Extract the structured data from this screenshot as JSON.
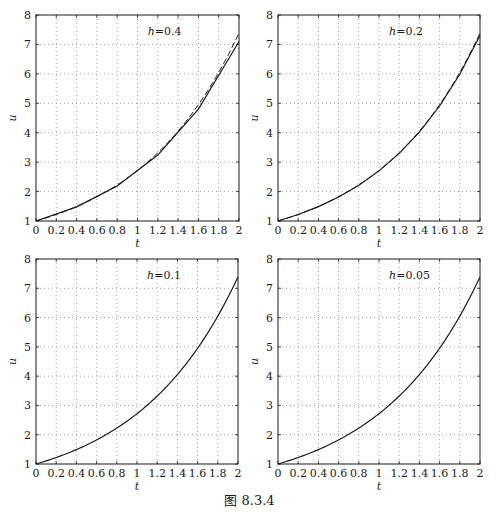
{
  "figure": {
    "caption": "图 8.3.4",
    "line_color": "#1a1a1a",
    "grid_color": "#8a8a8a",
    "background": "#ffffff"
  },
  "chart_data": [
    {
      "type": "line",
      "title": "",
      "annotation": "h=0.4",
      "xlabel": "t",
      "ylabel": "u",
      "xlim": [
        0,
        2
      ],
      "ylim": [
        1,
        8
      ],
      "xticks": [
        "0",
        "0.2",
        "0.4",
        "0.6",
        "0.8",
        "1",
        "1.2",
        "1.4",
        "1.6",
        "1.8",
        "2"
      ],
      "yticks": [
        "1",
        "2",
        "3",
        "4",
        "5",
        "6",
        "7",
        "8"
      ],
      "grid": true,
      "series": [
        {
          "name": "numerical",
          "style": "solid",
          "x": [
            0,
            0.4,
            0.8,
            1.2,
            1.6,
            2.0
          ],
          "y": [
            1.0,
            1.48,
            2.19,
            3.24,
            4.8,
            7.1
          ]
        },
        {
          "name": "exact e^t",
          "style": "dashed",
          "x": [
            0,
            0.2,
            0.4,
            0.6,
            0.8,
            1.0,
            1.2,
            1.4,
            1.6,
            1.8,
            2.0
          ],
          "y": [
            1.0,
            1.221,
            1.492,
            1.822,
            2.226,
            2.718,
            3.32,
            4.055,
            4.953,
            6.05,
            7.389
          ]
        }
      ]
    },
    {
      "type": "line",
      "title": "",
      "annotation": "h=0.2",
      "xlabel": "t",
      "ylabel": "u",
      "xlim": [
        0,
        2
      ],
      "ylim": [
        1,
        8
      ],
      "xticks": [
        "0",
        "0.2",
        "0.4",
        "0.6",
        "0.8",
        "1",
        "1.2",
        "1.4",
        "1.6",
        "1.8",
        "2"
      ],
      "yticks": [
        "1",
        "2",
        "3",
        "4",
        "5",
        "6",
        "7",
        "8"
      ],
      "grid": true,
      "series": [
        {
          "name": "numerical",
          "style": "solid",
          "x": [
            0,
            0.2,
            0.4,
            0.6,
            0.8,
            1.0,
            1.2,
            1.4,
            1.6,
            1.8,
            2.0
          ],
          "y": [
            1.0,
            1.22,
            1.488,
            1.816,
            2.215,
            2.703,
            3.297,
            4.023,
            4.908,
            5.987,
            7.305
          ]
        },
        {
          "name": "exact e^t",
          "style": "dashed",
          "x": [
            0,
            0.2,
            0.4,
            0.6,
            0.8,
            1.0,
            1.2,
            1.4,
            1.6,
            1.8,
            2.0
          ],
          "y": [
            1.0,
            1.221,
            1.492,
            1.822,
            2.226,
            2.718,
            3.32,
            4.055,
            4.953,
            6.05,
            7.389
          ]
        }
      ]
    },
    {
      "type": "line",
      "title": "",
      "annotation": "h=0.1",
      "xlabel": "t",
      "ylabel": "u",
      "xlim": [
        0,
        2
      ],
      "ylim": [
        1,
        8
      ],
      "xticks": [
        "0",
        "0.2",
        "0.4",
        "0.6",
        "0.8",
        "1",
        "1.2",
        "1.4",
        "1.6",
        "1.8",
        "2"
      ],
      "yticks": [
        "1",
        "2",
        "3",
        "4",
        "5",
        "6",
        "7",
        "8"
      ],
      "grid": true,
      "series": [
        {
          "name": "numerical",
          "style": "solid",
          "x": [
            0,
            0.2,
            0.4,
            0.6,
            0.8,
            1.0,
            1.2,
            1.4,
            1.6,
            1.8,
            2.0
          ],
          "y": [
            1.0,
            1.221,
            1.491,
            1.821,
            2.224,
            2.716,
            3.316,
            4.05,
            4.946,
            6.039,
            7.375
          ]
        },
        {
          "name": "exact e^t",
          "style": "dashed",
          "x": [
            0,
            0.2,
            0.4,
            0.6,
            0.8,
            1.0,
            1.2,
            1.4,
            1.6,
            1.8,
            2.0
          ],
          "y": [
            1.0,
            1.221,
            1.492,
            1.822,
            2.226,
            2.718,
            3.32,
            4.055,
            4.953,
            6.05,
            7.389
          ]
        }
      ]
    },
    {
      "type": "line",
      "title": "",
      "annotation": "h=0.05",
      "xlabel": "t",
      "ylabel": "u",
      "xlim": [
        0,
        2
      ],
      "ylim": [
        1,
        8
      ],
      "xticks": [
        "0",
        "0.2",
        "0.4",
        "0.6",
        "0.8",
        "1",
        "1.2",
        "1.4",
        "1.6",
        "1.8",
        "2"
      ],
      "yticks": [
        "1",
        "2",
        "3",
        "4",
        "5",
        "6",
        "7",
        "8"
      ],
      "grid": true,
      "series": [
        {
          "name": "numerical",
          "style": "solid",
          "x": [
            0,
            0.2,
            0.4,
            0.6,
            0.8,
            1.0,
            1.2,
            1.4,
            1.6,
            1.8,
            2.0
          ],
          "y": [
            1.0,
            1.221,
            1.492,
            1.822,
            2.225,
            2.718,
            3.319,
            4.054,
            4.951,
            6.047,
            7.386
          ]
        },
        {
          "name": "exact e^t",
          "style": "dashed",
          "x": [
            0,
            0.2,
            0.4,
            0.6,
            0.8,
            1.0,
            1.2,
            1.4,
            1.6,
            1.8,
            2.0
          ],
          "y": [
            1.0,
            1.221,
            1.492,
            1.822,
            2.226,
            2.718,
            3.32,
            4.055,
            4.953,
            6.05,
            7.389
          ]
        }
      ]
    }
  ]
}
